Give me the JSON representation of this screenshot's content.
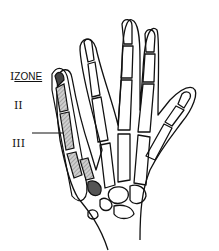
{
  "diagram": {
    "labels": [
      {
        "id": "zone-1",
        "numeral": "I",
        "text": "ZONE"
      },
      {
        "id": "zone-2",
        "numeral": "II"
      },
      {
        "id": "zone-3",
        "numeral": "III"
      }
    ],
    "colors": {
      "line": "#111111",
      "shade_light": "#bdbdbd",
      "shade_dark": "#555555"
    }
  }
}
